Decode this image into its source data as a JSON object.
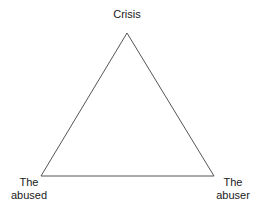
{
  "diagram": {
    "type": "triangle",
    "stroke_color": "#555555",
    "vertices": {
      "top": {
        "label": "Crisis"
      },
      "bottom_left": {
        "label_line1": "The",
        "label_line2": "abused"
      },
      "bottom_right": {
        "label_line1": "The",
        "label_line2": "abuser"
      }
    }
  }
}
